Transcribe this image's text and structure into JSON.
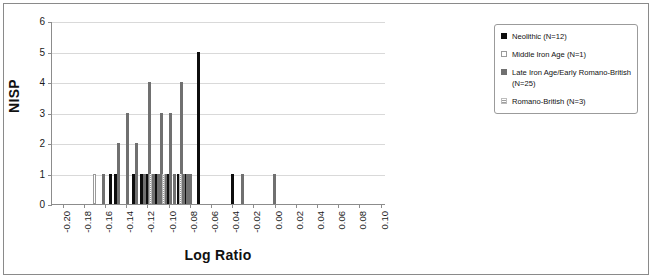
{
  "chart_data": {
    "type": "bar",
    "title": "",
    "xlabel": "Log Ratio",
    "ylabel": "NISP",
    "xlim": [
      -0.21,
      0.105
    ],
    "ylim": [
      0,
      6
    ],
    "grid": true,
    "legend_position": "right",
    "y_ticks": [
      "0",
      "1",
      "2",
      "3",
      "4",
      "5",
      "6"
    ],
    "x_ticks": [
      "-0.20",
      "-0.18",
      "-0.16",
      "-0.14",
      "-0.12",
      "-0.10",
      "-0.08",
      "-0.06",
      "-0.04",
      "-0.02",
      "0.00",
      "0.02",
      "0.04",
      "0.06",
      "0.08",
      "0.10"
    ],
    "series": [
      {
        "name": "Neolithic (N=12)",
        "key": "neolithic",
        "color": "#0d0d0d",
        "fill": "solid",
        "points": [
          {
            "x": -0.155,
            "y": 1
          },
          {
            "x": -0.15,
            "y": 1
          },
          {
            "x": -0.133,
            "y": 1
          },
          {
            "x": -0.126,
            "y": 1
          },
          {
            "x": -0.12,
            "y": 1
          },
          {
            "x": -0.116,
            "y": 1
          },
          {
            "x": -0.112,
            "y": 1
          },
          {
            "x": -0.1,
            "y": 1
          },
          {
            "x": -0.091,
            "y": 1
          },
          {
            "x": -0.084,
            "y": 1
          },
          {
            "x": -0.072,
            "y": 5
          },
          {
            "x": -0.04,
            "y": 1
          }
        ]
      },
      {
        "name": "Middle Iron Age (N=1)",
        "key": "middle-iron",
        "color": "#ffffff",
        "fill": "outline",
        "points": [
          {
            "x": -0.17,
            "y": 1
          }
        ]
      },
      {
        "name": "Late Iron Age/Early Romano-British (N=25)",
        "key": "late-iron",
        "color": "#707070",
        "fill": "solid-gray",
        "points": [
          {
            "x": -0.161,
            "y": 1
          },
          {
            "x": -0.147,
            "y": 2
          },
          {
            "x": -0.139,
            "y": 3
          },
          {
            "x": -0.13,
            "y": 2
          },
          {
            "x": -0.123,
            "y": 1
          },
          {
            "x": -0.118,
            "y": 4
          },
          {
            "x": -0.114,
            "y": 1
          },
          {
            "x": -0.11,
            "y": 1
          },
          {
            "x": -0.107,
            "y": 3
          },
          {
            "x": -0.103,
            "y": 1
          },
          {
            "x": -0.098,
            "y": 3
          },
          {
            "x": -0.094,
            "y": 1
          },
          {
            "x": -0.088,
            "y": 4
          },
          {
            "x": -0.086,
            "y": 1
          },
          {
            "x": -0.082,
            "y": 1
          },
          {
            "x": -0.079,
            "y": 1
          },
          {
            "x": -0.03,
            "y": 1
          },
          {
            "x": 0.0,
            "y": 1
          }
        ]
      },
      {
        "name": "Romano-British (N=3)",
        "key": "romano",
        "color": "#9e9e9e",
        "fill": "dotted",
        "points": [
          {
            "x": -0.117,
            "y": 1
          },
          {
            "x": -0.105,
            "y": 1
          },
          {
            "x": -0.089,
            "y": 1
          }
        ]
      }
    ]
  },
  "legend": {
    "items": [
      {
        "label": "Neolithic (N=12)",
        "key": "neolithic"
      },
      {
        "label": "Middle Iron Age (N=1)",
        "key": "middle-iron"
      },
      {
        "label": "Late Iron Age/Early Romano-British (N=25)",
        "key": "late-iron"
      },
      {
        "label": "Romano-British (N=3)",
        "key": "romano"
      }
    ]
  }
}
